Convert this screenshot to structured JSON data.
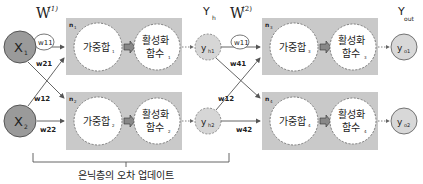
{
  "colors": {
    "box_fill": "#c9c9c9",
    "input_node": "#9a9a9a",
    "hidden_node": "#d6d6d6",
    "output_node": "#d8d8d8",
    "stroke": "#555555"
  },
  "layer_labels": {
    "w1": "W",
    "w1_sup": "(1)",
    "w2": "W",
    "w2_sup": "(2)",
    "yh": "Y",
    "yh_sub": "h",
    "yout": "Y",
    "yout_sub": "out"
  },
  "inputs": [
    {
      "label": "X",
      "sub": "1"
    },
    {
      "label": "X",
      "sub": "2"
    }
  ],
  "weights_layer1": {
    "w11": "w11",
    "w21": "w21",
    "w12": "w12",
    "w22": "w22"
  },
  "weights_layer2": {
    "w11": "w11",
    "w41": "w41",
    "w12": "w12",
    "w42": "w42"
  },
  "hidden_neurons": [
    {
      "n": "n",
      "n_sub": "1",
      "sum": "가중합",
      "sum_sub": "1",
      "act1": "활성화",
      "act2": "함수",
      "act_sub": "1"
    },
    {
      "n": "n",
      "n_sub": "2",
      "sum": "가중합",
      "sum_sub": "2",
      "act1": "활성화",
      "act2": "함수",
      "act_sub": "2"
    }
  ],
  "hidden_outputs": [
    {
      "label": "y",
      "sub": "h1"
    },
    {
      "label": "y",
      "sub": "h2"
    }
  ],
  "output_neurons": [
    {
      "n": "n",
      "n_sub": "3",
      "sum": "가중합",
      "sum_sub": "3",
      "act1": "활성화",
      "act2": "함수",
      "act_sub": "3"
    },
    {
      "n": "n",
      "n_sub": "4",
      "sum": "가중합",
      "sum_sub": "4",
      "act1": "활성화",
      "act2": "함수",
      "act_sub": "4"
    }
  ],
  "outputs": [
    {
      "label": "y",
      "sub": "o1"
    },
    {
      "label": "y",
      "sub": "o2"
    }
  ],
  "bracket_label": "은닉층의 오차 업데이트"
}
